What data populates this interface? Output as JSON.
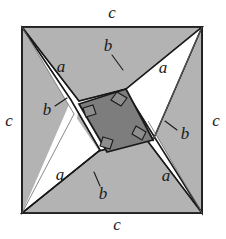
{
  "figure": {
    "type": "geometric-diagram",
    "width": 226,
    "height": 239,
    "background_color": "#ffffff"
  },
  "colors": {
    "background": "#ffffff",
    "triangle_fill": "#b3b3b3",
    "inner_square_fill": "#7d7d7d",
    "strip_fill": "#fbfbfb",
    "outline": "#1a1a1a",
    "thin_outline": "#555555",
    "label_color": "#1a1a1a"
  },
  "outer_square": {
    "name": "outer-square",
    "side_label": "c",
    "corners": [
      {
        "name": "top-left",
        "x": 22,
        "y": 27
      },
      {
        "name": "top-right",
        "x": 202,
        "y": 27
      },
      {
        "name": "bottom-right",
        "x": 202,
        "y": 213
      },
      {
        "name": "bottom-left",
        "x": 22,
        "y": 213
      }
    ]
  },
  "inner_square": {
    "name": "inner-square",
    "fill": "#7d7d7d",
    "points": "79,104 121,79 146,122 104,147"
  },
  "triangles": [
    {
      "name": "triangle-top",
      "points": "22,27 202,27 118,76",
      "leg_a_label": "a",
      "leg_b_label": "b",
      "hyp_label": "c"
    },
    {
      "name": "triangle-left",
      "points": "22,27 22,213 74,100",
      "leg_a_label": "a",
      "leg_b_label": "b",
      "hyp_label": "c"
    },
    {
      "name": "triangle-bottom",
      "points": "22,213 202,213 107,151",
      "leg_a_label": "a",
      "leg_b_label": "b",
      "hyp_label": "c"
    },
    {
      "name": "triangle-right",
      "points": "202,27 202,213 151,126",
      "leg_a_label": "a",
      "leg_b_label": "b",
      "hyp_label": "c"
    }
  ],
  "strips": [
    {
      "name": "strip-top",
      "points": "22,27 202,27 150,57 79,101"
    },
    {
      "name": "strip-left",
      "points": "22,27 22,213 100,150 71,100"
    },
    {
      "name": "strip-bottom",
      "points": "202,213 22,213 76,182 146,139"
    },
    {
      "name": "strip-right",
      "points": "202,213 202,27 126,89 153,140"
    }
  ],
  "labels": {
    "side_c": "c",
    "leg_a": "a",
    "leg_b": "b",
    "items": [
      {
        "id": "c-top",
        "name": "label-c-top",
        "text": "c",
        "x": 112,
        "y": 14
      },
      {
        "id": "c-left",
        "name": "label-c-left",
        "text": "c",
        "x": 9,
        "y": 122
      },
      {
        "id": "c-right",
        "name": "label-c-right",
        "text": "c",
        "x": 216,
        "y": 122
      },
      {
        "id": "c-bottom",
        "name": "label-c-bottom",
        "text": "c",
        "x": 117,
        "y": 226
      },
      {
        "id": "a-topleft",
        "name": "label-a-top-left",
        "text": "a",
        "x": 61,
        "y": 68
      },
      {
        "id": "a-topright",
        "name": "label-a-top-right",
        "text": "a",
        "x": 163,
        "y": 69
      },
      {
        "id": "a-botleft",
        "name": "label-a-bottom-left",
        "text": "a",
        "x": 60,
        "y": 176
      },
      {
        "id": "a-botright",
        "name": "label-a-bottom-right",
        "text": "a",
        "x": 166,
        "y": 177
      },
      {
        "id": "b-top",
        "name": "label-b-top",
        "text": "b",
        "x": 108,
        "y": 49
      },
      {
        "id": "b-left",
        "name": "label-b-left",
        "text": "b",
        "x": 48,
        "y": 110
      },
      {
        "id": "b-right",
        "name": "label-b-right",
        "text": "b",
        "x": 184,
        "y": 134
      },
      {
        "id": "b-bottom",
        "name": "label-b-bottom",
        "text": "b",
        "x": 102,
        "y": 193
      }
    ]
  },
  "leader_lines": [
    {
      "name": "leader-b-top",
      "x1": 112,
      "y1": 56,
      "x2": 122,
      "y2": 69
    },
    {
      "name": "leader-b-left",
      "x1": 55,
      "y1": 105,
      "x2": 66,
      "y2": 99
    },
    {
      "name": "leader-b-right",
      "x1": 177,
      "y1": 130,
      "x2": 165,
      "y2": 122
    },
    {
      "name": "leader-b-bottom",
      "x1": 100,
      "y1": 186,
      "x2": 95,
      "y2": 173
    }
  ],
  "right_angle_marks": [
    {
      "name": "right-angle-mark-inner-top",
      "cx": 118,
      "cy": 86
    },
    {
      "name": "right-angle-mark-inner-left",
      "cx": 87,
      "cy": 104
    },
    {
      "name": "right-angle-mark-inner-right",
      "cx": 139,
      "cy": 123
    },
    {
      "name": "right-angle-mark-inner-bottom",
      "cx": 107,
      "cy": 142
    }
  ]
}
